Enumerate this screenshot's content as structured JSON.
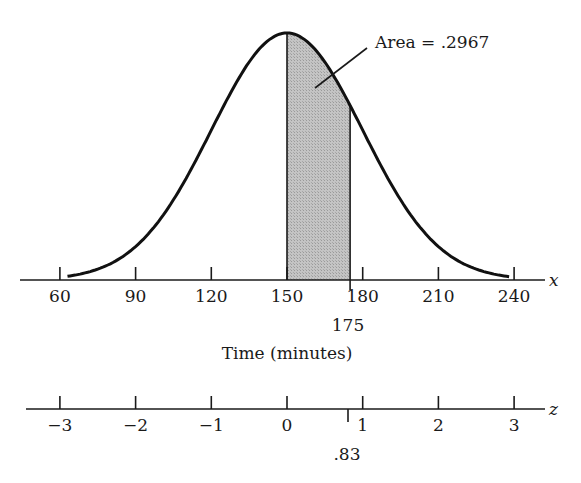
{
  "chart_data": {
    "type": "area",
    "title": "",
    "distribution": {
      "mean": 150,
      "std_dev": 30
    },
    "x_axis": {
      "label": "Time (minutes)",
      "variable": "x",
      "ticks": [
        60,
        90,
        120,
        150,
        180,
        210,
        240
      ],
      "tick_labels": [
        "60",
        "90",
        "120",
        "150",
        "180",
        "210",
        "240"
      ],
      "marker": {
        "value": 175,
        "label": "175"
      },
      "range": [
        60,
        240
      ]
    },
    "z_axis": {
      "variable": "z",
      "ticks": [
        -3,
        -2,
        -1,
        0,
        1,
        2,
        3
      ],
      "tick_labels": [
        "−3",
        "−2",
        "−1",
        "0",
        "1",
        "2",
        "3"
      ],
      "marker": {
        "value": 0.83,
        "label": ".83"
      }
    },
    "shaded_region": {
      "from": 150,
      "to": 175,
      "area": 0.2967
    },
    "annotation": "Area = .2967",
    "grid": false,
    "legend": null
  },
  "labels": {
    "x_var": "x",
    "z_var": "z",
    "x_axis_title": "Time (minutes)",
    "annotation": "Area = .2967",
    "x_marker": "175",
    "z_marker": ".83",
    "x_ticks": [
      "60",
      "90",
      "120",
      "150",
      "180",
      "210",
      "240"
    ],
    "z_ticks": [
      "−3",
      "−2",
      "−1",
      "0",
      "1",
      "2",
      "3"
    ]
  },
  "colors": {
    "curve": "#111111",
    "shade": "#bdbdbd",
    "axis": "#1a1a1a"
  }
}
